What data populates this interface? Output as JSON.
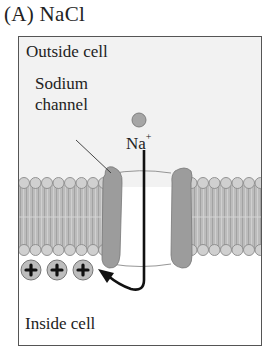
{
  "panel": {
    "label": "(A)  NaCl"
  },
  "regions": {
    "outside": "Outside cell",
    "inside": "Inside cell"
  },
  "channel": {
    "label_line1": "Sodium",
    "label_line2": "channel"
  },
  "ion": {
    "symbol": "Na",
    "charge": "+"
  },
  "positive_charges": {
    "count": 3,
    "glyph": "plus"
  },
  "colors": {
    "outside_bg": "#f2f2f2",
    "inside_bg": "#ffffff",
    "membrane_tails": "#b4b4b4",
    "membrane_heads": "#cfcfcf",
    "channel_protein": "#9a9a9a",
    "ion": "#a6a6a6",
    "arrow": "#111111",
    "frame": "#555555"
  }
}
